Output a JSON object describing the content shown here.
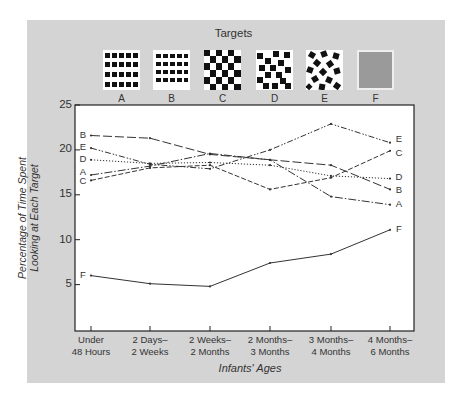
{
  "chart_data": {
    "type": "line",
    "title": "Targets",
    "xlabel": "Infants' Ages",
    "ylabel_line1": "Percentage of Time Spent",
    "ylabel_line2": "Looking at Each Target",
    "ylim": [
      0,
      25
    ],
    "yticks": [
      5,
      10,
      15,
      20,
      25
    ],
    "grid": false,
    "legend_position": "top (pattern swatches) and line-end labels",
    "categories": [
      [
        "Under",
        "48 Hours"
      ],
      [
        "2 Days–",
        "2 Weeks"
      ],
      [
        "2 Weeks–",
        "2 Months"
      ],
      [
        "2 Months–",
        "3 Months"
      ],
      [
        "3 Months–",
        "4 Months"
      ],
      [
        "4 Months–",
        "6 Months"
      ]
    ],
    "series": [
      {
        "name": "A",
        "pattern": "regular grid of small squares",
        "style": "dash-dot",
        "values": [
          17.2,
          18.2,
          19.6,
          18.9,
          14.8,
          13.9
        ]
      },
      {
        "name": "B",
        "pattern": "regular grid of smaller squares",
        "style": "long-dash",
        "values": [
          21.6,
          21.3,
          19.5,
          18.9,
          18.3,
          15.6
        ]
      },
      {
        "name": "C",
        "pattern": "checkerboard",
        "style": "dashed",
        "values": [
          16.6,
          18.0,
          18.3,
          15.6,
          16.9,
          19.9
        ]
      },
      {
        "name": "D",
        "pattern": "irregular squares",
        "style": "dotted",
        "values": [
          18.9,
          18.5,
          18.6,
          18.3,
          17.1,
          16.8
        ]
      },
      {
        "name": "E",
        "pattern": "random rotated squares",
        "style": "dash-dot-dot",
        "values": [
          20.2,
          18.4,
          17.9,
          20.0,
          22.9,
          20.8
        ]
      },
      {
        "name": "F",
        "pattern": "plain gray",
        "style": "solid",
        "values": [
          6.0,
          5.1,
          4.8,
          7.4,
          8.4,
          11.1
        ]
      }
    ]
  },
  "targets": {
    "title": "Targets",
    "labels": [
      "A",
      "B",
      "C",
      "D",
      "E",
      "F"
    ]
  },
  "axes": {
    "y_ticks": [
      "25",
      "20",
      "15",
      "10",
      "5"
    ],
    "x_ticks": [
      {
        "line1": "Under",
        "line2": "48 Hours"
      },
      {
        "line1": "2 Days–",
        "line2": "2 Weeks"
      },
      {
        "line1": "2 Weeks–",
        "line2": "2 Months"
      },
      {
        "line1": "2 Months–",
        "line2": "3 Months"
      },
      {
        "line1": "3 Months–",
        "line2": "4 Months"
      },
      {
        "line1": "4 Months–",
        "line2": "6 Months"
      }
    ],
    "xlabel": "Infants' Ages",
    "ylabel_line1": "Percentage of Time Spent",
    "ylabel_line2": "Looking at Each Target"
  },
  "series_labels": {
    "start": [
      "B",
      "E",
      "D",
      "A",
      "C",
      "F"
    ],
    "end": [
      "E",
      "C",
      "D",
      "B",
      "A",
      "F"
    ]
  },
  "colors": {
    "panel": "#d4d4d4",
    "plot_bg": "#ffffff",
    "line": "#333333",
    "target_f": "#9a9a9a"
  }
}
